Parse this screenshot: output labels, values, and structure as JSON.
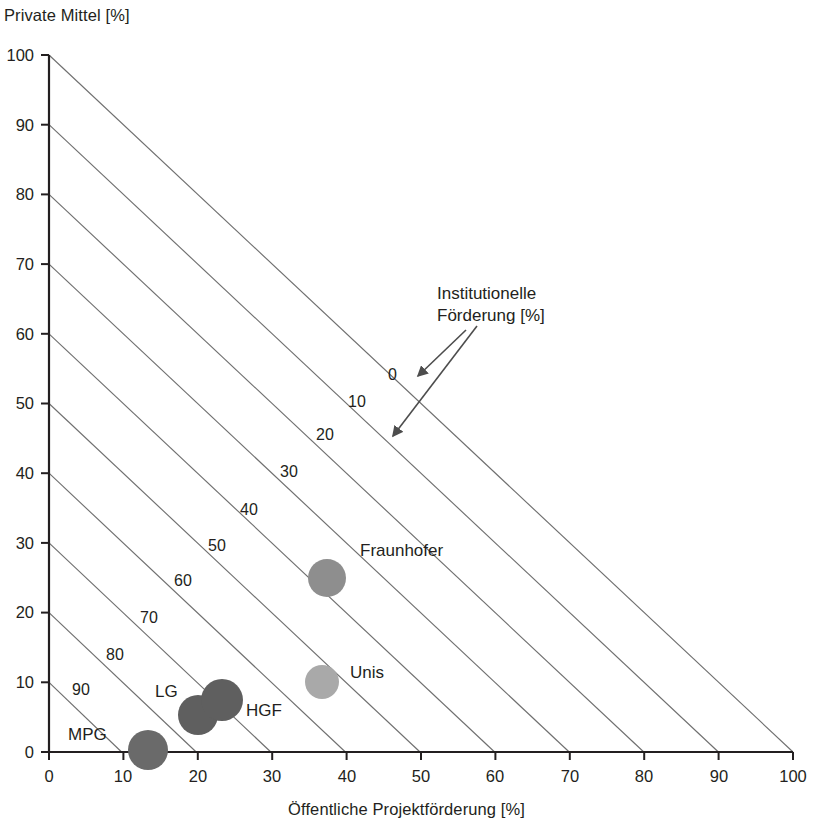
{
  "chart_data": {
    "type": "scatter",
    "title": "",
    "xlabel": "Öffentliche Projektförderung [%]",
    "ylabel": "Private Mittel [%]",
    "xlim": [
      0,
      100
    ],
    "ylim": [
      0,
      100
    ],
    "grid": false,
    "xticks": [
      "0",
      "10",
      "20",
      "30",
      "40",
      "50",
      "60",
      "70",
      "80",
      "90",
      "100"
    ],
    "yticks": [
      "0",
      "10",
      "20",
      "30",
      "40",
      "50",
      "60",
      "70",
      "80",
      "90",
      "100"
    ],
    "annotation": {
      "line1": "Institutionelle",
      "line2": "Förderung [%]"
    },
    "isolines": {
      "description": "Diagonal lines of constant institutional funding: x + y + institutional = 100",
      "labels": [
        "0",
        "10",
        "20",
        "30",
        "40",
        "50",
        "60",
        "70",
        "80",
        "90"
      ],
      "values": [
        0,
        10,
        20,
        30,
        40,
        50,
        60,
        70,
        80,
        90
      ]
    },
    "points": [
      {
        "label": "MPG",
        "x": 13.3,
        "y": 0.3,
        "size": 20,
        "color": "#6a6a6a"
      },
      {
        "label": "LG",
        "x": 20.0,
        "y": 5.3,
        "size": 20,
        "color": "#5f5f5f"
      },
      {
        "label": "HGF",
        "x": 23.2,
        "y": 7.4,
        "size": 21,
        "color": "#5f5f5f"
      },
      {
        "label": "Unis",
        "x": 36.7,
        "y": 10.0,
        "size": 17,
        "color": "#a9a9a9"
      },
      {
        "label": "Fraunhofer",
        "x": 37.4,
        "y": 24.9,
        "size": 19,
        "color": "#8e8e8e"
      }
    ]
  },
  "axis": {
    "y_title": "Private Mittel [%]",
    "x_title": "Öffentliche Projektförderung [%]",
    "y_ticks": [
      {
        "value": "100"
      },
      {
        "value": "90"
      },
      {
        "value": "80"
      },
      {
        "value": "70"
      },
      {
        "value": "60"
      },
      {
        "value": "50"
      },
      {
        "value": "40"
      },
      {
        "value": "30"
      },
      {
        "value": "20"
      },
      {
        "value": "10"
      },
      {
        "value": "0"
      }
    ],
    "x_ticks": [
      {
        "value": "0"
      },
      {
        "value": "10"
      },
      {
        "value": "20"
      },
      {
        "value": "30"
      },
      {
        "value": "40"
      },
      {
        "value": "50"
      },
      {
        "value": "60"
      },
      {
        "value": "70"
      },
      {
        "value": "80"
      },
      {
        "value": "90"
      },
      {
        "value": "100"
      }
    ]
  },
  "isoline_labels": [
    {
      "text": "0"
    },
    {
      "text": "10"
    },
    {
      "text": "20"
    },
    {
      "text": "30"
    },
    {
      "text": "40"
    },
    {
      "text": "50"
    },
    {
      "text": "60"
    },
    {
      "text": "70"
    },
    {
      "text": "80"
    },
    {
      "text": "90"
    }
  ],
  "bubbles": [
    {
      "label": "MPG"
    },
    {
      "label": "LG"
    },
    {
      "label": "HGF"
    },
    {
      "label": "Unis"
    },
    {
      "label": "Fraunhofer"
    }
  ],
  "annotation": {
    "line1": "Institutionelle",
    "line2": "Förderung [%]"
  },
  "colors": {
    "axis": "#231f20",
    "isoline": "#6f6f6f",
    "text": "#231f20",
    "bubble_dark": "#5f5f5f",
    "bubble_mid": "#8e8e8e",
    "bubble_light": "#a9a9a9"
  }
}
